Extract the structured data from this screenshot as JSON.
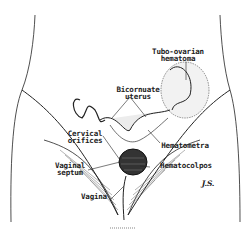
{
  "figure": {
    "labels": [
      {
        "id": "tubo",
        "text_line1": "Tubo-ovarian",
        "text_line2": "hematoma"
      },
      {
        "id": "bicornuate",
        "text_line1": "Bicornuate",
        "text_line2": "uterus"
      },
      {
        "id": "cervical",
        "text_line1": "Cervical",
        "text_line2": "orifices"
      },
      {
        "id": "hematometra",
        "text_line1": "Hematometra"
      },
      {
        "id": "septum",
        "text_line1": "Vaginal",
        "text_line2": "septum"
      },
      {
        "id": "hematocolpos",
        "text_line1": "Hematocolpos"
      },
      {
        "id": "vagina",
        "text_line1": "Vagina"
      }
    ],
    "signature": "J.S."
  }
}
